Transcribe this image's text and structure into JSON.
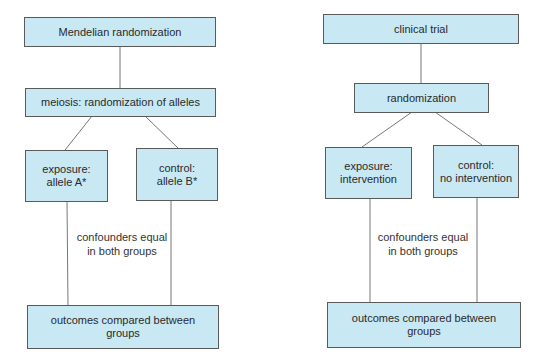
{
  "colors": {
    "box_fill": "#c8e8f4",
    "box_border": "#5a5a5a",
    "line": "#777777",
    "text": "#2a2a2a"
  },
  "left_diagram": {
    "top": {
      "text": "Mendelian randomization"
    },
    "middle": {
      "text": "meiosis: randomization of alleles"
    },
    "exposure": {
      "line1": "exposure:",
      "line2": "allele A*"
    },
    "control": {
      "line1": "control:",
      "line2": "allele B*"
    },
    "note": {
      "line1": "confounders equal",
      "line2": "in both groups"
    },
    "bottom": {
      "line1": "outcomes compared between",
      "line2": "groups"
    }
  },
  "right_diagram": {
    "top": {
      "text": "clinical trial"
    },
    "middle": {
      "text": "randomization"
    },
    "exposure": {
      "line1": "exposure:",
      "line2": "intervention"
    },
    "control": {
      "line1": "control:",
      "line2": "no intervention"
    },
    "note": {
      "line1": "confounders equal",
      "line2": "in both groups"
    },
    "bottom": {
      "line1": "outcomes compared between",
      "line2": "groups"
    }
  }
}
